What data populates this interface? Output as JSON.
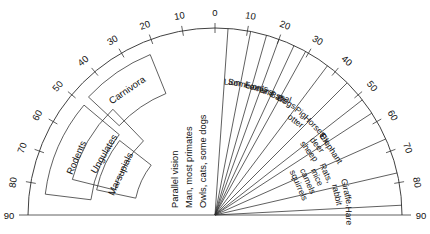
{
  "figure": {
    "type": "polar-half-diagram",
    "title": "",
    "center": {
      "x": 215,
      "y": 215
    },
    "radius": 187,
    "axis": {
      "unit": "degrees",
      "start": -90,
      "end": 90,
      "step": 10,
      "labels": [
        "90",
        "80",
        "70",
        "60",
        "50",
        "40",
        "30",
        "20",
        "10",
        "0",
        "10",
        "20",
        "30",
        "40",
        "50",
        "60",
        "70",
        "80",
        "90"
      ]
    }
  },
  "center_note": {
    "line1": "Parallel vision",
    "line2": "Man, most primates",
    "line3": "Owls, cats, some dogs"
  },
  "rays": [
    {
      "label": "Lion",
      "angle": 4
    },
    {
      "label": "Some cats",
      "angle": 11
    },
    {
      "label": "Lemurs",
      "angle": 16
    },
    {
      "label": "Fox and seal",
      "angle": 20
    },
    {
      "label": "Bats",
      "angle": 25
    },
    {
      "label": "Dogs",
      "angle": 29
    },
    {
      "label": "Pig, otter",
      "angle": 37
    },
    {
      "label": "Horses",
      "angle": 45
    },
    {
      "label": "Ox, deer, sheep",
      "angle": 52
    },
    {
      "label": "Elephant",
      "angle": 57
    },
    {
      "label": "Rats, mice, camels, squirrels",
      "angle": 66
    },
    {
      "label": "Giraffe, rabbit",
      "angle": 77
    },
    {
      "label": "Hare",
      "angle": 87
    }
  ],
  "groups": [
    {
      "label": "Carnivora",
      "from": 22,
      "to": 47
    },
    {
      "label": "Rodents",
      "from": 50,
      "to": 83
    },
    {
      "label": "Ungulates",
      "from": 44,
      "to": 76
    },
    {
      "label": "Marsupials",
      "from": 52,
      "to": 78
    }
  ],
  "chart_data": {
    "type": "polar",
    "xlabel": "degrees from midline",
    "ylabel": "",
    "axis_range": [
      -90,
      90
    ],
    "tick_step": 10,
    "grid": false,
    "legend": "none",
    "categories": [
      "Lion",
      "Some cats",
      "Lemurs",
      "Fox and seal",
      "Bats",
      "Dogs",
      "Pig, otter",
      "Horses",
      "Ox, deer, sheep",
      "Elephant",
      "Rats, mice, camels, squirrels",
      "Giraffe, rabbit",
      "Hare"
    ],
    "values": [
      4,
      11,
      16,
      20,
      25,
      29,
      37,
      45,
      52,
      57,
      66,
      77,
      87
    ],
    "annotations": [
      "Parallel vision",
      "Man, most primates",
      "Owls, cats, some dogs",
      "Carnivora",
      "Rodents",
      "Ungulates",
      "Marsupials"
    ]
  },
  "colors": {
    "ink": "#2b2b2b",
    "background": "#ffffff"
  }
}
